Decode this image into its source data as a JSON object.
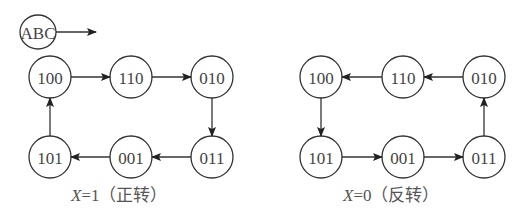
{
  "legend": {
    "label": "ABC"
  },
  "diagrams": [
    {
      "id": "forward",
      "caption_var": "X",
      "caption_rest": "=1（正转）",
      "nodes": [
        "100",
        "110",
        "010",
        "011",
        "001",
        "101"
      ],
      "cycle": [
        "100",
        "110",
        "010",
        "011",
        "001",
        "101",
        "100"
      ]
    },
    {
      "id": "reverse",
      "caption_var": "X",
      "caption_rest": "=0（反转）",
      "nodes": [
        "100",
        "110",
        "010",
        "011",
        "001",
        "101"
      ],
      "cycle": [
        "100",
        "101",
        "001",
        "011",
        "010",
        "110",
        "100"
      ]
    }
  ]
}
